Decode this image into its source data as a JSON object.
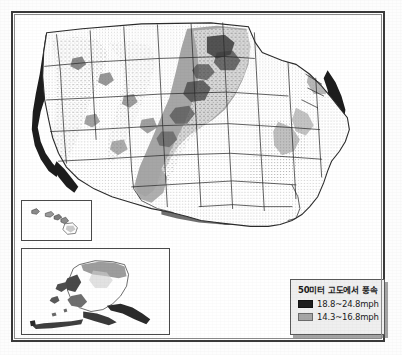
{
  "figure": {
    "kind": "thematic-map",
    "region": "United States",
    "has_frame": true
  },
  "legend": {
    "title": "50미터 고도에서 풍속",
    "entries": [
      {
        "label": "18.8~24.8mph",
        "color": "#1d1d1d",
        "swatch_name": "legend-swatch-high"
      },
      {
        "label": "14.3~16.8mph",
        "color": "#a6a6a6",
        "swatch_name": "legend-swatch-medium"
      }
    ]
  },
  "insets": [
    {
      "name": "hawaii-inset",
      "label": "Hawaii"
    },
    {
      "name": "alaska-inset",
      "label": "Alaska"
    }
  ],
  "colors": {
    "high_wind": "#1d1d1d",
    "medium_wind": "#a6a6a6",
    "land": "#ffffff",
    "outline": "#2b2b2b",
    "frame": "#3a3a3a",
    "legend_background": "#efefef",
    "page_background": "#ffffff"
  }
}
